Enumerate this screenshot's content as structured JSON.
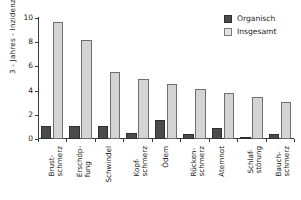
{
  "chart_data": {
    "type": "bar",
    "title": "",
    "xlabel": "",
    "ylabel": "3 - Jahres - Inzidenz",
    "ylim": [
      0,
      10
    ],
    "yticks": [
      0,
      2,
      4,
      6,
      8,
      10
    ],
    "grid": false,
    "legend_position": "top-right",
    "categories": [
      "Brust-\nschmerz",
      "Erschöp-\nfung",
      "Schwindel",
      "Kopf-\nschmerz",
      "Ödem",
      "Rücken-\nschmerz",
      "Atemnot",
      "Schlaf-\nstörung",
      "Bauch-\nschmerz"
    ],
    "series": [
      {
        "name": "Organisch",
        "color": "#4b4b4b",
        "values": [
          1.1,
          1.05,
          1.05,
          0.5,
          1.6,
          0.45,
          0.95,
          0.1,
          0.4
        ]
      },
      {
        "name": "Insgesamt",
        "color": "#d4d4d4",
        "values": [
          9.7,
          8.2,
          5.55,
          5.0,
          4.55,
          4.1,
          3.8,
          3.5,
          3.1
        ]
      }
    ]
  },
  "legend": {
    "items": [
      {
        "label": "Organisch"
      },
      {
        "label": "Insgesamt"
      }
    ]
  },
  "axis": {
    "y_title": "3 - Jahres - Inzidenz",
    "y_ticklabels": [
      "0",
      "2",
      "4",
      "6",
      "8",
      "10"
    ]
  }
}
